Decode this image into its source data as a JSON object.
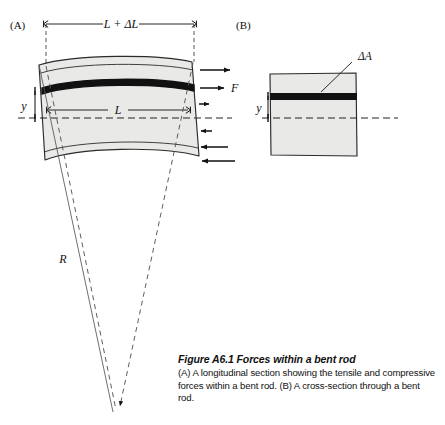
{
  "figure": {
    "panels": [
      {
        "id": "A",
        "label": "(A)",
        "name": "longitudinal-section",
        "labels": {
          "top_dimension": "L + ΔL",
          "inner_dimension": "L",
          "offset_distance": "y",
          "force": "F",
          "radius": "R"
        }
      },
      {
        "id": "B",
        "label": "(B)",
        "name": "cross-section",
        "labels": {
          "area_element": "ΔA",
          "offset_distance": "y"
        }
      }
    ],
    "caption": {
      "title": "Figure A6.1  Forces within a bent rod",
      "body": "(A) A longitudinal section showing the tensile and compressive forces within a bent rod. (B) A cross-section through a bent rod."
    },
    "colors": {
      "rod_fill": "#e9e9e7",
      "band": "#111111",
      "outline": "#2b2b2b",
      "dashed": "#333333",
      "text": "#111111",
      "background": "#ffffff"
    }
  }
}
